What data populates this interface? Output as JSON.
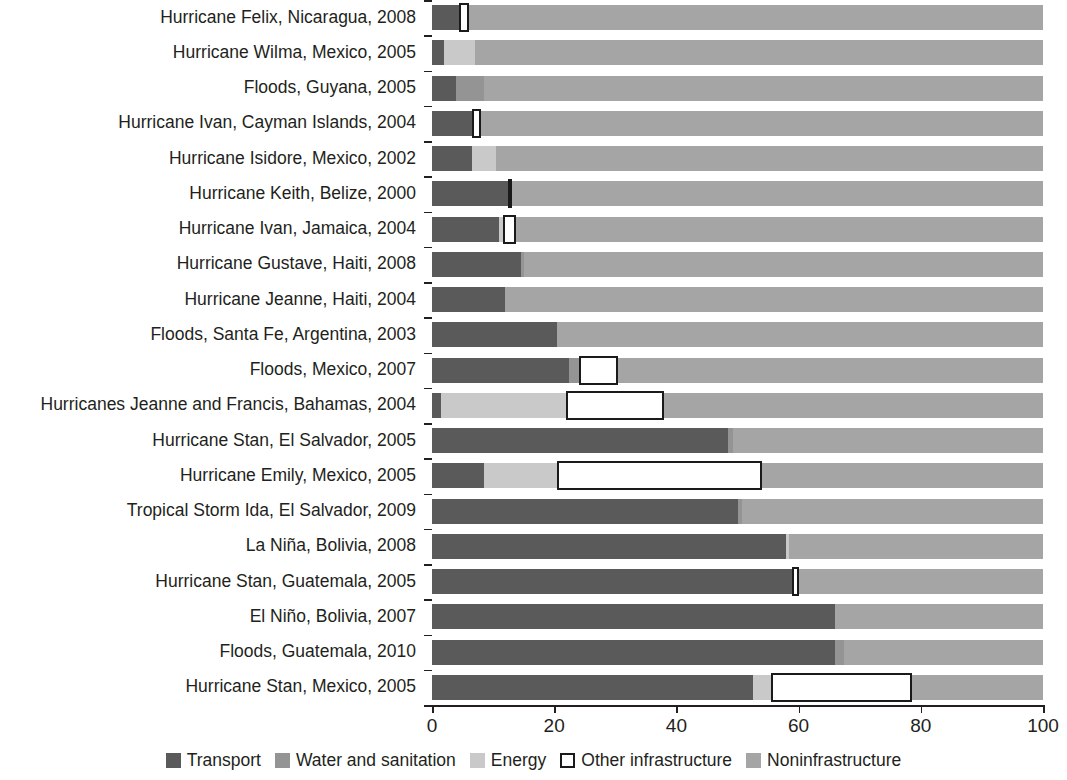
{
  "chart_data": {
    "type": "bar",
    "orientation": "horizontal",
    "stacked": true,
    "normalized": true,
    "title": "",
    "subtitle": "",
    "xlabel": "",
    "ylabel": "",
    "xlim": [
      0,
      100
    ],
    "xticks": [
      0,
      20,
      40,
      60,
      80,
      100
    ],
    "xtick_labels": [
      "0",
      "20",
      "40",
      "60",
      "80",
      "100"
    ],
    "grid": false,
    "legend_position": "bottom",
    "legend": [
      {
        "name": "Transport",
        "color": "#5a5a5a",
        "swatch": "filled"
      },
      {
        "name": "Water and sanitation",
        "color": "#949494",
        "swatch": "filled"
      },
      {
        "name": "Energy",
        "color": "#c9c9c9",
        "swatch": "filled"
      },
      {
        "name": "Other infrastructure",
        "color": "#ffffff",
        "swatch": "outlined"
      },
      {
        "name": "Noninfrastructure",
        "color": "#a5a5a5",
        "swatch": "filled"
      }
    ],
    "categories": [
      "Hurricane Felix, Nicaragua, 2008",
      "Hurricane Wilma, Mexico, 2005",
      "Floods, Guyana, 2005",
      "Hurricane Ivan, Cayman Islands, 2004",
      "Hurricane Isidore, Mexico, 2002",
      "Hurricane Keith, Belize, 2000",
      "Hurricane Ivan, Jamaica, 2004",
      "Hurricane Gustave, Haiti, 2008",
      "Hurricane Jeanne, Haiti, 2004",
      "Floods, Santa Fe, Argentina, 2003",
      "Floods, Mexico, 2007",
      "Hurricanes Jeanne and Francis, Bahamas, 2004",
      "Hurricane Stan, El Salvador, 2005",
      "Hurricane Emily, Mexico, 2005",
      "Tropical Storm Ida, El Salvador, 2009",
      "La Niña, Bolivia, 2008",
      "Hurricane Stan, Guatemala, 2005",
      "El Niño, Bolivia, 2007",
      "Floods, Guatemala, 2010",
      "Hurricane Stan, Mexico, 2005"
    ],
    "series": [
      {
        "name": "Transport",
        "key": "transport",
        "color": "#5a5a5a",
        "values": [
          4.5,
          2.0,
          4.0,
          6.5,
          6.5,
          12.5,
          11.0,
          14.5,
          12.0,
          20.5,
          22.5,
          1.5,
          48.5,
          8.5,
          50.0,
          58.0,
          59.0,
          66.0,
          66.0,
          52.5
        ]
      },
      {
        "name": "Water and sanitation",
        "key": "water",
        "color": "#949494",
        "values": [
          0.0,
          0.0,
          4.5,
          0.0,
          0.0,
          0.0,
          0.0,
          0.5,
          0.0,
          0.0,
          1.5,
          0.0,
          0.7,
          0.0,
          0.7,
          0.0,
          0.0,
          0.0,
          1.5,
          0.0
        ]
      },
      {
        "name": "Energy",
        "key": "energy",
        "color": "#c9c9c9",
        "values": [
          0.0,
          5.0,
          0.0,
          0.0,
          4.0,
          0.0,
          0.7,
          0.0,
          0.0,
          0.0,
          0.0,
          20.5,
          0.0,
          12.0,
          0.0,
          0.5,
          0.0,
          0.0,
          0.0,
          3.0
        ]
      },
      {
        "name": "Other infrastructure",
        "key": "other",
        "color": "#ffffff",
        "values": [
          1.5,
          0.0,
          0.0,
          1.5,
          0.0,
          0.5,
          2.0,
          0.0,
          0.0,
          0.0,
          6.5,
          16.0,
          0.0,
          33.5,
          0.0,
          0.0,
          1.0,
          0.0,
          0.0,
          23.0
        ]
      },
      {
        "name": "Noninfrastructure",
        "key": "noninfra",
        "color": "#a5a5a5",
        "values": [
          94.0,
          93.0,
          91.5,
          92.0,
          89.5,
          87.0,
          86.3,
          85.0,
          88.0,
          79.5,
          69.5,
          62.0,
          50.8,
          46.0,
          49.3,
          41.5,
          40.0,
          34.0,
          32.5,
          21.5
        ]
      }
    ]
  }
}
